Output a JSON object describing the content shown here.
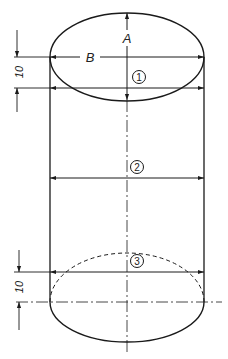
{
  "diagram": {
    "labels": {
      "A": "A",
      "B": "B",
      "dim_top": "10",
      "dim_bottom": "10"
    },
    "markers": [
      {
        "id": "1",
        "label": "1"
      },
      {
        "id": "2",
        "label": "2"
      },
      {
        "id": "3",
        "label": "3"
      }
    ],
    "colors": {
      "ink": "#1a1a1a",
      "paper": "#ffffff"
    }
  }
}
